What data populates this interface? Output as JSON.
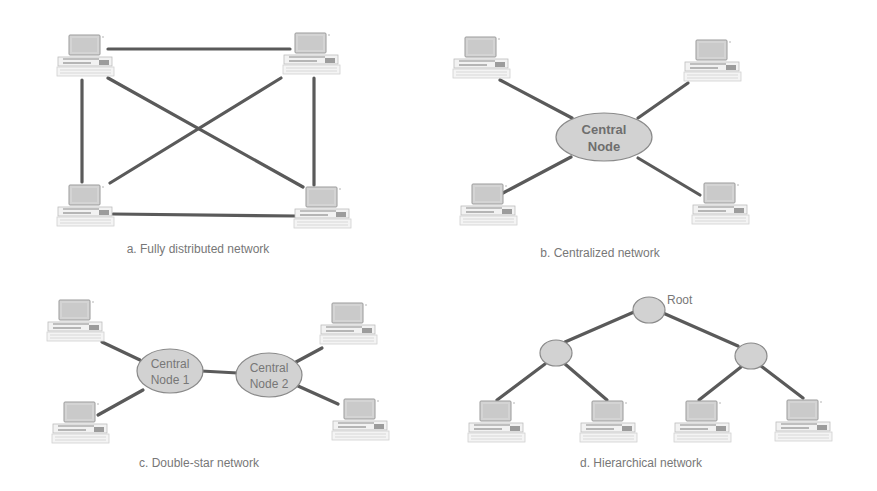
{
  "figure": {
    "panels": [
      {
        "id": "a",
        "caption": "a. Fully distributed network",
        "nodes": [
          "computer-1",
          "computer-2",
          "computer-3",
          "computer-4"
        ],
        "links": [
          [
            "computer-1",
            "computer-2"
          ],
          [
            "computer-1",
            "computer-3"
          ],
          [
            "computer-1",
            "computer-4"
          ],
          [
            "computer-2",
            "computer-3"
          ],
          [
            "computer-2",
            "computer-4"
          ],
          [
            "computer-3",
            "computer-4"
          ]
        ]
      },
      {
        "id": "b",
        "caption": "b. Centralized network",
        "central_node": {
          "line1": "Central",
          "line2": "Node"
        },
        "links": [
          [
            "central",
            "computer-1"
          ],
          [
            "central",
            "computer-2"
          ],
          [
            "central",
            "computer-3"
          ],
          [
            "central",
            "computer-4"
          ]
        ]
      },
      {
        "id": "c",
        "caption": "c. Double-star network",
        "central_node_1": {
          "line1": "Central",
          "line2": "Node 1"
        },
        "central_node_2": {
          "line1": "Central",
          "line2": "Node 2"
        },
        "links": [
          [
            "central-1",
            "computer-1"
          ],
          [
            "central-1",
            "computer-2"
          ],
          [
            "central-1",
            "central-2"
          ],
          [
            "central-2",
            "computer-3"
          ],
          [
            "central-2",
            "computer-4"
          ]
        ]
      },
      {
        "id": "d",
        "caption": "d. Hierarchical network",
        "root_label": "Root",
        "links": [
          [
            "root",
            "mid-left"
          ],
          [
            "root",
            "mid-right"
          ],
          [
            "mid-left",
            "computer-1"
          ],
          [
            "mid-left",
            "computer-2"
          ],
          [
            "mid-right",
            "computer-3"
          ],
          [
            "mid-right",
            "computer-4"
          ]
        ]
      }
    ]
  },
  "colors": {
    "link": "#5a5a5a",
    "node_fill": "#d2d2d2",
    "text": "#777777",
    "background": "#ffffff"
  }
}
